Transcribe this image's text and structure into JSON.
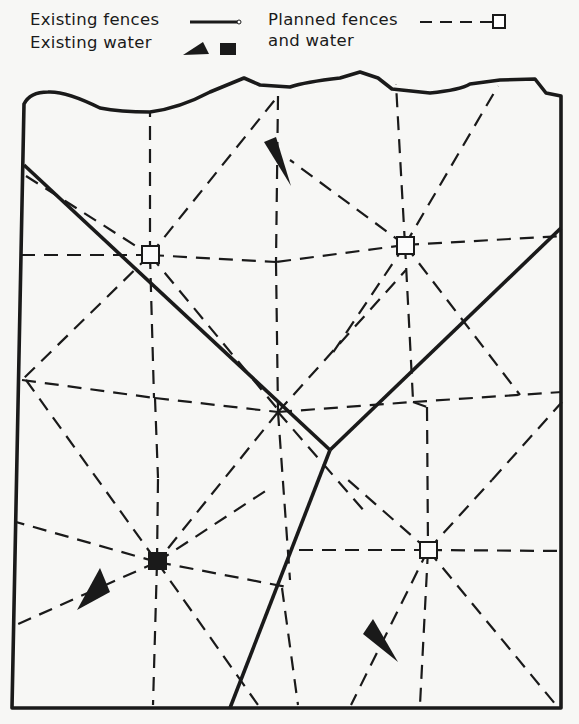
{
  "legend": {
    "existing_fences": "Existing fences",
    "existing_water": "Existing water",
    "planned_line1": "Planned fences",
    "planned_line2": "and water"
  },
  "colors": {
    "ink": "#1a1a1a",
    "paper": "#f7f7f5"
  },
  "diagram": {
    "planned_water_points": [
      {
        "id": "pw1",
        "x": 150,
        "y": 255
      },
      {
        "id": "pw2",
        "x": 405,
        "y": 245
      },
      {
        "id": "pw3",
        "x": 428,
        "y": 550
      }
    ],
    "existing_water_tanks": [
      {
        "id": "ew-square",
        "x": 157,
        "y": 562
      }
    ],
    "existing_water_troughs": [
      {
        "id": "ew-tri-1",
        "points": "266,140 280,137 290,186"
      },
      {
        "id": "ew-tri-2",
        "points": "100,572 110,600 78,610"
      },
      {
        "id": "ew-tri-3",
        "points": "373,619 364,633 398,662"
      }
    ]
  }
}
